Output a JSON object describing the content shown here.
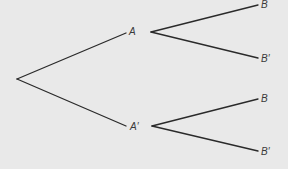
{
  "diagram": {
    "type": "probability-tree",
    "background_color": "#e9e9e9",
    "line_color": "#2a2a2a",
    "root": {
      "x": 17,
      "y": 79
    },
    "first_level": [
      {
        "label": "A",
        "label_pos": {
          "x": 129,
          "y": 27
        },
        "branch_end": {
          "x": 126,
          "y": 33
        },
        "fork_start": {
          "x": 151,
          "y": 32
        },
        "children": [
          {
            "label": "B",
            "label_pos": {
              "x": 261,
              "y": 0
            },
            "branch_end": {
              "x": 258,
              "y": 5
            }
          },
          {
            "label": "B′",
            "label_pos": {
              "x": 261,
              "y": 54
            },
            "branch_end": {
              "x": 258,
              "y": 58
            }
          }
        ]
      },
      {
        "label": "A′",
        "label_pos": {
          "x": 130,
          "y": 122
        },
        "branch_end": {
          "x": 126,
          "y": 126
        },
        "fork_start": {
          "x": 152,
          "y": 126
        },
        "children": [
          {
            "label": "B",
            "label_pos": {
              "x": 261,
              "y": 94
            },
            "branch_end": {
              "x": 258,
              "y": 99
            }
          },
          {
            "label": "B′",
            "label_pos": {
              "x": 261,
              "y": 147
            },
            "branch_end": {
              "x": 258,
              "y": 151
            }
          }
        ]
      }
    ]
  }
}
